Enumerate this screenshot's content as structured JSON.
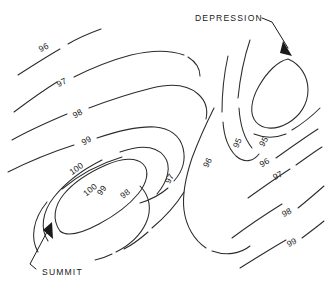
{
  "figure": {
    "background_color": "#ffffff",
    "line_color": "#2b2b2b",
    "text_color": "#1a1a1a",
    "width": 326,
    "height": 286
  },
  "annotations": {
    "depression": {
      "label": "DEPRESSION",
      "text_x": 195,
      "text_y": 21,
      "leader": "M 262 18 L 272 22 L 288 48",
      "arrow": "M 283 41 L 292 56 L 280 53 Z"
    },
    "summit": {
      "label": "SUMMIT",
      "text_x": 42,
      "text_y": 275,
      "leader": "M 36 269 L 30 264 L 47 232",
      "arrow": "M 52 222 L 53 239 L 43 230 Z"
    }
  },
  "contour_labels": [
    {
      "value": "96",
      "x": 45,
      "y": 50,
      "rotate": -27
    },
    {
      "value": "97",
      "x": 63,
      "y": 85,
      "rotate": -27
    },
    {
      "value": "98",
      "x": 79,
      "y": 116,
      "rotate": -30
    },
    {
      "value": "99",
      "x": 88,
      "y": 143,
      "rotate": -32
    },
    {
      "value": "100",
      "x": 78,
      "y": 171,
      "rotate": -35
    },
    {
      "value": "100",
      "x": 92,
      "y": 192,
      "rotate": -40
    },
    {
      "value": "99",
      "x": 104,
      "y": 192,
      "rotate": -52
    },
    {
      "value": "98",
      "x": 127,
      "y": 196,
      "rotate": -38
    },
    {
      "value": "97",
      "x": 172,
      "y": 180,
      "rotate": -62
    },
    {
      "value": "96",
      "x": 210,
      "y": 164,
      "rotate": -62
    },
    {
      "value": "95",
      "x": 240,
      "y": 144,
      "rotate": -66
    },
    {
      "value": "95",
      "x": 266,
      "y": 143,
      "rotate": -58
    },
    {
      "value": "96",
      "x": 266,
      "y": 165,
      "rotate": -32
    },
    {
      "value": "97",
      "x": 279,
      "y": 178,
      "rotate": -28
    },
    {
      "value": "98",
      "x": 288,
      "y": 215,
      "rotate": -28
    },
    {
      "value": "99",
      "x": 293,
      "y": 245,
      "rotate": -28
    }
  ],
  "contour_paths": [
    {
      "name": "contour-96-upper-left-a",
      "d": "M 18 75 C 32 66 46 57 60 49"
    },
    {
      "name": "contour-96-upper-left-b",
      "d": "M 68 44 C 78 38 90 33 101 29"
    },
    {
      "name": "contour-97-upper-left-a",
      "d": "M 14 112 C 30 100 44 90 57 82"
    },
    {
      "name": "contour-97-upper-left-b",
      "d": "M 74 77 C 94 67 112 60 131 55 C 152 50 170 50 184 55"
    },
    {
      "name": "contour-97-upper-right",
      "d": "M 188 57 C 196 62 200 68 200 76"
    },
    {
      "name": "contour-98-upper-left-a",
      "d": "M 12 140 C 28 131 48 122 67 114"
    },
    {
      "name": "contour-98-upper-left-b",
      "d": "M 89 108 C 110 100 132 93 152 88 C 172 83 188 85 198 94 C 206 101 208 110 206 119"
    },
    {
      "name": "contour-99-left-a",
      "d": "M 8 172 C 28 162 52 152 74 145"
    },
    {
      "name": "contour-99-left-b",
      "d": "M 97 138 C 118 131 140 126 155 127 C 170 128 180 136 183 148 C 186 160 182 172 174 181"
    },
    {
      "name": "contour-99-inner-right",
      "d": "M 168 188 C 160 195 150 200 140 203"
    },
    {
      "name": "contour-100-summit-closed",
      "d": "M 60 231 C 52 220 54 206 64 194 C 74 182 90 172 106 165 C 122 158 136 157 143 164 C 150 171 147 183 138 194 C 129 205 114 216 99 224 C 84 232 68 238 60 231 Z"
    },
    {
      "name": "contour-100-outer-summit",
      "d": "M 48 241 C 40 229 42 212 54 197 C 66 182 84 169 102 160"
    },
    {
      "name": "contour-100-outer-summit-b",
      "d": "M 120 152 C 140 145 156 146 164 156 C 172 166 168 181 157 194"
    },
    {
      "name": "contour-98-lower-left",
      "d": "M 38 252 C 30 238 33 219 47 202"
    },
    {
      "name": "contour-98-lower-left-b",
      "d": "M 62 189 C 80 174 102 163 122 157"
    },
    {
      "name": "contour-98-mid-lower",
      "d": "M 140 186 C 150 196 152 210 146 223 C 140 236 128 246 116 252"
    },
    {
      "name": "contour-98-lower-tail",
      "d": "M 112 254 C 106 257 100 259 95 260"
    },
    {
      "name": "contour-97-saddle-left",
      "d": "M 184 192 C 176 205 164 218 152 228"
    },
    {
      "name": "contour-97-saddle-left-b",
      "d": "M 148 232 C 140 239 132 245 124 249"
    },
    {
      "name": "contour-96-saddle-loop",
      "d": "M 214 108 C 206 124 198 142 192 158 C 186 176 182 194 184 210 C 186 226 194 240 206 248"
    },
    {
      "name": "contour-96-saddle-loop-b",
      "d": "M 212 251 C 226 256 240 254 250 246"
    },
    {
      "name": "contour-95-left-branch",
      "d": "M 228 56 C 224 74 222 94 222 112"
    },
    {
      "name": "contour-95-left-branch-b",
      "d": "M 223 122 C 224 136 228 148 236 156 C 244 163 253 162 259 154"
    },
    {
      "name": "contour-95-depression-closed",
      "d": "M 288 59 C 300 64 308 76 308 90 C 308 104 300 116 288 123 C 276 130 263 130 256 122 C 249 114 251 100 259 86 C 267 72 278 61 288 59 Z"
    },
    {
      "name": "contour-96-depression-outer",
      "d": "M 254 134 C 264 138 276 138 286 134"
    },
    {
      "name": "contour-96-depression-outer-b",
      "d": "M 292 130 C 302 124 312 116 320 108"
    },
    {
      "name": "contour-96-right-edge",
      "d": "M 276 158 C 290 148 304 138 318 129"
    },
    {
      "name": "contour-97-right-edge",
      "d": "M 248 198 C 262 188 276 178 290 169"
    },
    {
      "name": "contour-97-right-edge-b",
      "d": "M 296 165 C 306 158 314 152 322 147"
    },
    {
      "name": "contour-98-right-edge",
      "d": "M 232 238 C 248 226 266 214 282 204"
    },
    {
      "name": "contour-98-right-edge-b",
      "d": "M 298 208 C 308 200 316 193 324 186"
    },
    {
      "name": "contour-99-right-edge",
      "d": "M 240 268 C 256 258 272 248 286 240"
    },
    {
      "name": "contour-99-right-edge-b",
      "d": "M 302 238 C 310 232 318 226 324 221"
    },
    {
      "name": "contour-95-mid-vertical",
      "d": "M 250 40 C 244 58 240 78 238 98"
    },
    {
      "name": "contour-95-mid-vertical-b",
      "d": "M 239 108 C 240 124 244 138 252 148"
    }
  ]
}
